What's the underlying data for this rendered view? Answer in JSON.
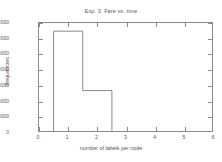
{
  "chart_data": {
    "type": "bar",
    "title": "Exp. 3: Fare vs. time",
    "xlabel": "number of labels per node",
    "ylabel": "frequencies",
    "xlim": [
      0,
      6
    ],
    "ylim": [
      0,
      700000
    ],
    "xticks": [
      0,
      1,
      2,
      3,
      4,
      5,
      6
    ],
    "xtick_labels": [
      "0",
      "1",
      "2",
      "3",
      "4",
      "5",
      "6"
    ],
    "yticks": [
      0,
      100000,
      200000,
      300000,
      400000,
      500000,
      600000,
      700000
    ],
    "ytick_labels": [
      "0",
      "100000",
      "200000",
      "300000",
      "400000",
      "500000",
      "600000",
      "700000"
    ],
    "grid": false,
    "legend": null,
    "bin_width": 1,
    "bin_edges": [
      0.5,
      1.5,
      2.5,
      3.5,
      4.5,
      5.5
    ],
    "categories": [
      "1",
      "2",
      "3",
      "4",
      "5"
    ],
    "values": [
      648000,
      270000,
      6000,
      1500,
      800
    ],
    "series": [
      {
        "name": "frequencies",
        "values": [
          648000,
          270000,
          6000,
          1500,
          800
        ]
      }
    ],
    "line_color": "#8a8a8a",
    "background": "#ffffff"
  },
  "axis": {
    "tick_color": "#8a8a8a",
    "text_color": "#555555"
  }
}
